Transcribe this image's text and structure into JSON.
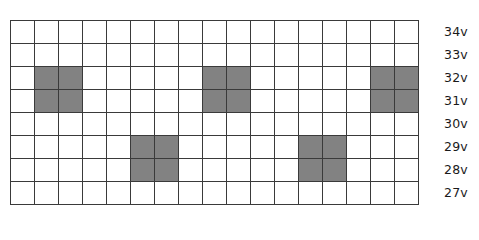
{
  "chart_data": {
    "type": "heatmap",
    "title": "",
    "xlabel": "",
    "ylabel": "",
    "grid": true,
    "legend_position": "none",
    "n_columns": 17,
    "n_rows": 8,
    "row_labels": [
      "34v",
      "33v",
      "32v",
      "31v",
      "30v",
      "29v",
      "28v",
      "27v"
    ],
    "column_labels": [
      "1",
      "2",
      "3",
      "4",
      "5",
      "6",
      "7",
      "8",
      "9",
      "10",
      "11",
      "12",
      "13",
      "14",
      "15",
      "16",
      "17"
    ],
    "fill_color": "#828282",
    "empty_color": "#ffffff",
    "gridline_color": "#3a3a3a",
    "cell_states": [
      [
        0,
        0,
        0,
        0,
        0,
        0,
        0,
        0,
        0,
        0,
        0,
        0,
        0,
        0,
        0,
        0,
        0
      ],
      [
        0,
        0,
        0,
        0,
        0,
        0,
        0,
        0,
        0,
        0,
        0,
        0,
        0,
        0,
        0,
        0,
        0
      ],
      [
        0,
        1,
        1,
        0,
        0,
        0,
        0,
        0,
        1,
        1,
        0,
        0,
        0,
        0,
        0,
        1,
        1
      ],
      [
        0,
        1,
        1,
        0,
        0,
        0,
        0,
        0,
        1,
        1,
        0,
        0,
        0,
        0,
        0,
        1,
        1
      ],
      [
        0,
        0,
        0,
        0,
        0,
        0,
        0,
        0,
        0,
        0,
        0,
        0,
        0,
        0,
        0,
        0,
        0
      ],
      [
        0,
        0,
        0,
        0,
        0,
        1,
        1,
        0,
        0,
        0,
        0,
        0,
        1,
        1,
        0,
        0,
        0
      ],
      [
        0,
        0,
        0,
        0,
        0,
        1,
        1,
        0,
        0,
        0,
        0,
        0,
        1,
        1,
        0,
        0,
        0
      ],
      [
        0,
        0,
        0,
        0,
        0,
        0,
        0,
        0,
        0,
        0,
        0,
        0,
        0,
        0,
        0,
        0,
        0
      ]
    ],
    "filled_blocks": [
      {
        "rows": [
          "32v",
          "31v"
        ],
        "columns": [
          2,
          3
        ]
      },
      {
        "rows": [
          "29v",
          "28v"
        ],
        "columns": [
          6,
          7
        ]
      },
      {
        "rows": [
          "32v",
          "31v"
        ],
        "columns": [
          9,
          10
        ]
      },
      {
        "rows": [
          "29v",
          "28v"
        ],
        "columns": [
          13,
          14
        ]
      },
      {
        "rows": [
          "32v",
          "31v"
        ],
        "columns": [
          16,
          17
        ]
      }
    ]
  }
}
